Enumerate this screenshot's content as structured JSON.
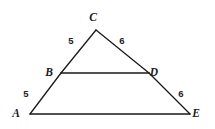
{
  "figure": {
    "background_color": "#ffffff",
    "line_color": "#1a1a1a",
    "label_color": "#1b1b1b"
  },
  "vertices": [
    {
      "name": "A",
      "label": "A",
      "x": 30,
      "y": 114,
      "label_x": 16,
      "label_y": 117
    },
    {
      "name": "B",
      "label": "B",
      "x": 61,
      "y": 73,
      "label_x": 49,
      "label_y": 76
    },
    {
      "name": "C",
      "label": "C",
      "x": 96,
      "y": 30,
      "label_x": 93,
      "label_y": 21
    },
    {
      "name": "D",
      "label": "D",
      "x": 149,
      "y": 73,
      "label_x": 154,
      "label_y": 76
    },
    {
      "name": "E",
      "label": "E",
      "x": 190,
      "y": 114,
      "label_x": 196,
      "label_y": 117
    }
  ],
  "segments": [
    {
      "name": "segment-CB",
      "from": "C",
      "to": "B",
      "x1": 96,
      "y1": 30,
      "x2": 61,
      "y2": 73,
      "width": 1.3
    },
    {
      "name": "segment-BA",
      "from": "B",
      "to": "A",
      "x1": 61,
      "y1": 73,
      "x2": 30,
      "y2": 114,
      "width": 1.3
    },
    {
      "name": "segment-CD",
      "from": "C",
      "to": "D",
      "x1": 96,
      "y1": 30,
      "x2": 149,
      "y2": 73,
      "width": 1.3
    },
    {
      "name": "segment-DE",
      "from": "D",
      "to": "E",
      "x1": 149,
      "y1": 73,
      "x2": 190,
      "y2": 114,
      "width": 1.3
    },
    {
      "name": "segment-BD",
      "from": "B",
      "to": "D",
      "x1": 61,
      "y1": 73,
      "x2": 149,
      "y2": 73,
      "width": 1.3
    },
    {
      "name": "segment-AE",
      "from": "A",
      "to": "E",
      "x1": 30,
      "y1": 114,
      "x2": 190,
      "y2": 114,
      "width": 1.3
    }
  ],
  "measures": [
    {
      "name": "measure-CB",
      "segment": "CB",
      "value": "5",
      "x": 71,
      "y": 44
    },
    {
      "name": "measure-CD",
      "segment": "CD",
      "value": "6",
      "x": 122,
      "y": 44
    },
    {
      "name": "measure-BA",
      "segment": "BA",
      "value": "5",
      "x": 26,
      "y": 97
    },
    {
      "name": "measure-DE",
      "segment": "DE",
      "value": "6",
      "x": 181,
      "y": 97
    }
  ]
}
